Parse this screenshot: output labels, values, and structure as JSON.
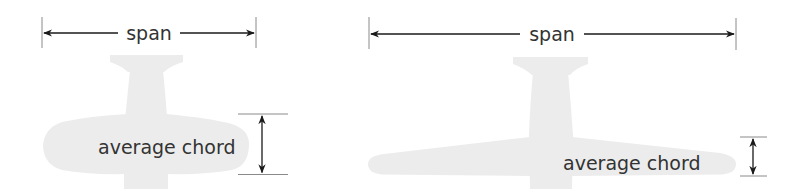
{
  "colors": {
    "silhouette": "#ececec",
    "line": "#1a1a1a",
    "tick": "#8a8a8a",
    "text": "#333333",
    "background": "#ffffff"
  },
  "diagrams": [
    {
      "id": "low-aspect-ratio",
      "span_label": "span",
      "chord_label": "average chord"
    },
    {
      "id": "high-aspect-ratio",
      "span_label": "span",
      "chord_label": "average chord"
    }
  ]
}
